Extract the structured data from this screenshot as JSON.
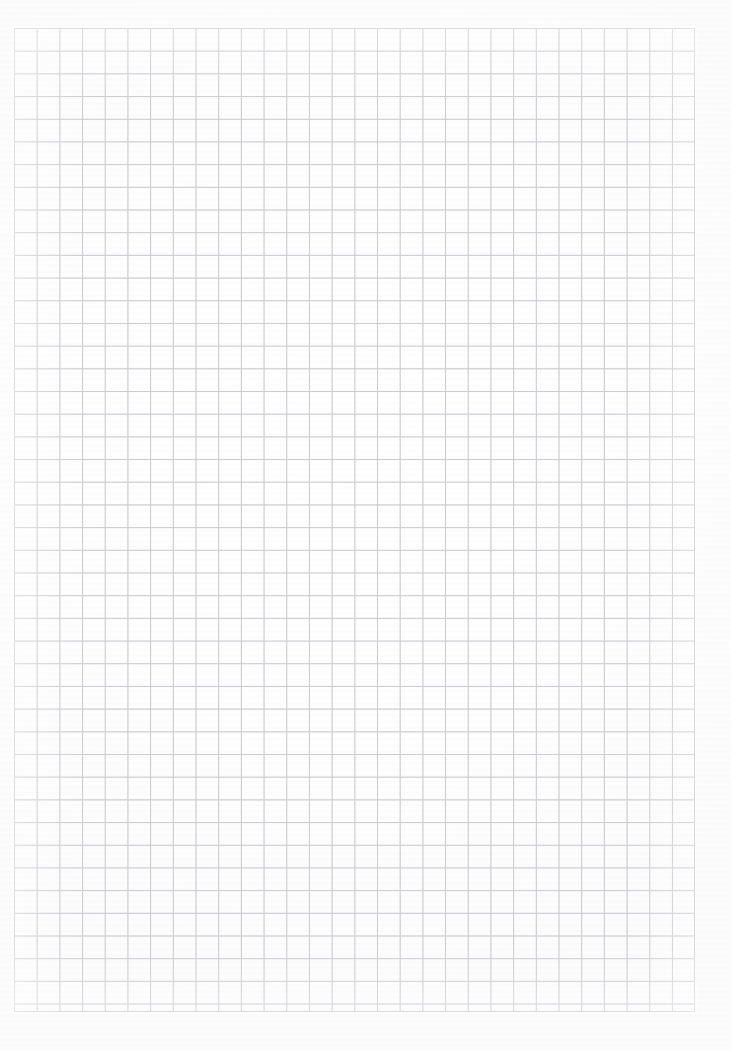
{
  "page": {
    "width_px": 731,
    "height_px": 1050,
    "background_color": "#fefefe",
    "content_text": "",
    "has_text": false
  },
  "grid": {
    "label": "square grid",
    "line_color": "#c9c9cd",
    "line_width_px": 1,
    "cell_size_px": 22.7,
    "columns": 30,
    "rows": 43,
    "left_px": 14,
    "top_px": 28,
    "width_px": 681,
    "height_px": 984
  },
  "margins": {
    "top_px": 28,
    "left_px": 14,
    "right_px": 36,
    "bottom_px": 38
  }
}
